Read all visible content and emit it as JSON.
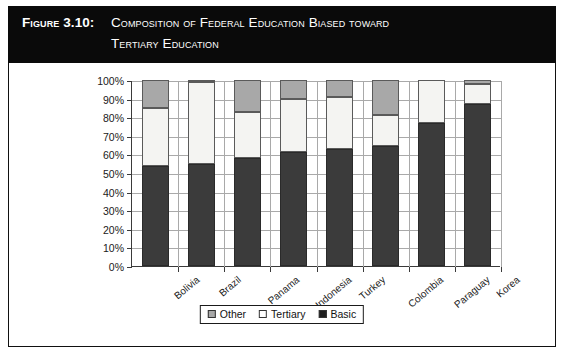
{
  "figure": {
    "label": "Figure 3.10:",
    "title_line_1": "Composition of Federal Education Biased toward",
    "title_line_2": "Tertiary Education"
  },
  "legend": {
    "items": [
      {
        "label": "Other",
        "swatch": "gray-swatch-icon",
        "color": "#a8a8a8"
      },
      {
        "label": "Tertiary",
        "swatch": "white-swatch-icon",
        "color": "#ffffff"
      },
      {
        "label": "Basic",
        "swatch": "black-swatch-icon",
        "color": "#1e1e1e"
      }
    ]
  },
  "axes": {
    "y_ticks": [
      "100%",
      "90%",
      "80%",
      "70%",
      "60%",
      "50%",
      "40%",
      "30%",
      "20%",
      "10%",
      "0%"
    ]
  },
  "chart_data": {
    "type": "bar",
    "stacked": true,
    "stack_total": 100,
    "title": "Composition of Federal Education Biased toward Tertiary Education",
    "xlabel": "",
    "ylabel": "",
    "ylim": [
      0,
      100
    ],
    "ytick_step": 10,
    "grid": true,
    "legend_position": "bottom",
    "categories": [
      "Bolivia",
      "Brazil",
      "Panama",
      "Indonesia",
      "Turkey",
      "Colombia",
      "Paraguay",
      "Korea"
    ],
    "series": [
      {
        "name": "Basic",
        "color": "#3b3b3b",
        "values": [
          54,
          55,
          58,
          61.5,
          63,
          64.5,
          77,
          87
        ]
      },
      {
        "name": "Tertiary",
        "color": "#f4f4f2",
        "values": [
          31,
          44,
          25,
          28.5,
          28,
          16.5,
          23,
          11
        ]
      },
      {
        "name": "Other",
        "color": "#a8a8a8",
        "values": [
          15,
          1,
          17,
          10,
          9,
          19,
          0,
          2
        ]
      }
    ],
    "cumulative_tops": {
      "basic": [
        54,
        55,
        58,
        61.5,
        63,
        64.5,
        77,
        87
      ],
      "basic_plus_tertiary": [
        85,
        99,
        83,
        90,
        91,
        81,
        100,
        98
      ],
      "total": [
        100,
        100,
        100,
        100,
        100,
        100,
        100,
        100
      ]
    }
  }
}
